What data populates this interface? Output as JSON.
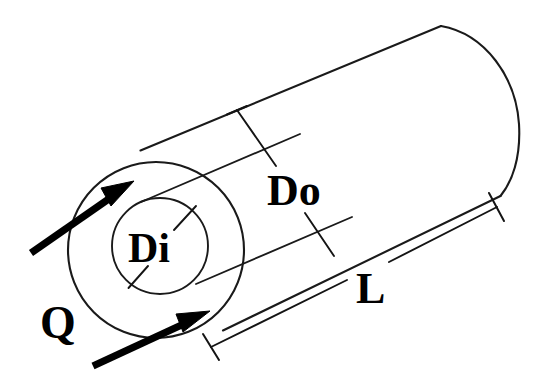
{
  "figure": {
    "background_color": "#ffffff",
    "line_color": "#1a1a1a",
    "text_color": "#000000",
    "width": 542,
    "height": 391
  },
  "labels": {
    "heat_flow": "Q",
    "inner_diameter": "Di",
    "outer_diameter": "Do",
    "length": "L"
  },
  "geometry": {
    "outer_circle": {
      "cx": 156,
      "cy": 250,
      "r": 88
    },
    "inner_circle": {
      "cx": 160,
      "cy": 246,
      "r": 48
    },
    "axis_angle_deg": -23,
    "far_cap": {
      "top_x": 440,
      "top_y": 26,
      "bottom_x": 500,
      "bottom_y": 196
    }
  },
  "annotations": {
    "arrow_upper": {
      "from_x": 30,
      "from_y": 253,
      "to_x": 132,
      "to_y": 184
    },
    "arrow_lower": {
      "from_x": 92,
      "from_y": 366,
      "to_x": 208,
      "to_y": 312
    },
    "do_dimension": {
      "start_x": 236,
      "start_y": 110,
      "end_x": 333,
      "end_y": 256
    },
    "l_dimension": {
      "start_x": 212,
      "start_y": 346,
      "end_x": 498,
      "end_y": 207
    },
    "di_dimension": {
      "start_x": 130,
      "start_y": 285,
      "end_x": 195,
      "end_y": 212
    }
  }
}
